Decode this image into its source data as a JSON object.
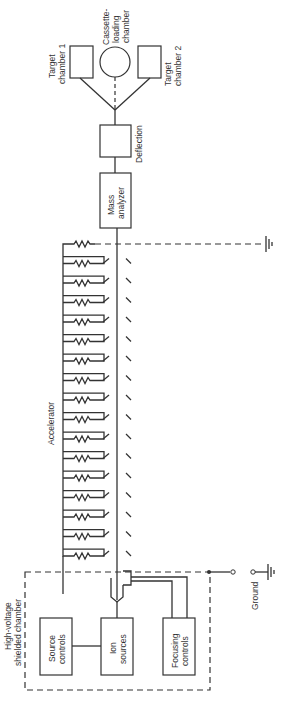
{
  "diagram": {
    "type": "block-diagram",
    "colors": {
      "line": "#333333",
      "background": "#ffffff"
    },
    "components": {
      "target_chamber_1": {
        "label_line1": "Target",
        "label_line2": "chamber 1"
      },
      "cassette_loading_chamber": {
        "label_line1": "Cassette-",
        "label_line2": "loading",
        "label_line3": "chamber"
      },
      "target_chamber_2": {
        "label_line1": "Target",
        "label_line2": "chamber 2"
      },
      "deflection": {
        "label": "Deflection"
      },
      "mass_analyzer": {
        "label_line1": "Mass",
        "label_line2": "analyzer"
      },
      "accelerator": {
        "label": "Accelerator",
        "stages": 17
      },
      "chamber": {
        "label_line1": "High-voltage",
        "label_line2": "shielded chamber"
      },
      "source_controls": {
        "label_line1": "Source",
        "label_line2": "controls"
      },
      "ion_sources": {
        "label_line1": "Ion",
        "label_line2": "sources"
      },
      "focusing_controls": {
        "label_line1": "Focusing",
        "label_line2": "controls"
      },
      "ground": {
        "label": "Ground"
      }
    },
    "connections": [
      [
        "ion_sources",
        "accelerator"
      ],
      [
        "source_controls",
        "ion_sources"
      ],
      [
        "focusing_controls",
        "accelerator"
      ],
      [
        "accelerator",
        "mass_analyzer"
      ],
      [
        "mass_analyzer",
        "deflection"
      ],
      [
        "deflection",
        "target_chamber_1"
      ],
      [
        "deflection",
        "cassette_loading_chamber"
      ],
      [
        "deflection",
        "target_chamber_2"
      ],
      [
        "chamber",
        "ground"
      ]
    ]
  }
}
